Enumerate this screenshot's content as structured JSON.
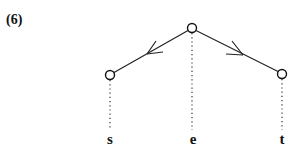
{
  "example_number": "(6)",
  "tree": {
    "nodes": [
      {
        "id": "root",
        "x": 192,
        "y": 28
      },
      {
        "id": "left",
        "x": 110,
        "y": 75
      },
      {
        "id": "right",
        "x": 282,
        "y": 74
      }
    ],
    "edges": [
      {
        "from": "root",
        "to": "left",
        "arrow": "toward-left"
      },
      {
        "from": "root",
        "to": "right",
        "arrow": "toward-right"
      }
    ],
    "leaf_labels": [
      "s",
      "e",
      "t"
    ]
  }
}
